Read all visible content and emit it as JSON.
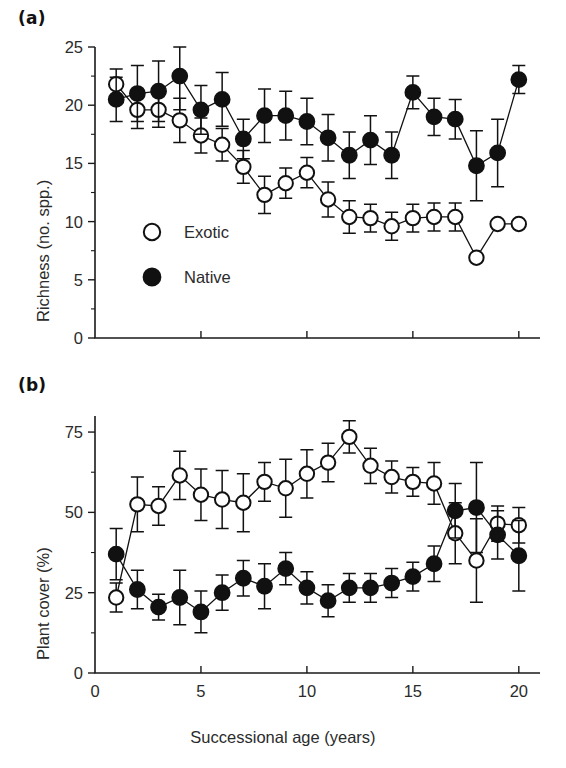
{
  "figure": {
    "panel_a_tag": "(a)",
    "panel_b_tag": "(b)",
    "x_axis_title": "Successional age (years)",
    "panel_a_y_title": "Richness (no. spp.)",
    "panel_b_y_title": "Plant cover (%)",
    "legend": {
      "exotic_label": "Exotic",
      "native_label": "Native",
      "exotic_marker": "open-circle",
      "native_marker": "filled-circle"
    },
    "marker_color": "#111111",
    "background_color": "#ffffff"
  },
  "chart_data": [
    {
      "type": "line",
      "panel": "(a)",
      "title": "Richness (no. spp.) vs Successional age",
      "xlabel": "Successional age (years)",
      "ylabel": "Richness (no. spp.)",
      "xlim": [
        0,
        21
      ],
      "ylim": [
        0,
        25
      ],
      "xticks": [
        0,
        5,
        10,
        15,
        20
      ],
      "xtick_labels": [
        "0",
        "5",
        "10",
        "15",
        "20"
      ],
      "yticks": [
        0,
        5,
        10,
        15,
        20,
        25
      ],
      "ytick_labels": [
        "0",
        "5",
        "10",
        "15",
        "20",
        "25"
      ],
      "yticks_minor": [
        2.5,
        7.5,
        12.5,
        17.5,
        22.5
      ],
      "grid": false,
      "legend_position": "inside-lower-left",
      "x": [
        1,
        2,
        3,
        4,
        5,
        6,
        7,
        8,
        9,
        10,
        11,
        12,
        13,
        14,
        15,
        16,
        17,
        18,
        19,
        20
      ],
      "series": [
        {
          "name": "Exotic",
          "marker": "open-circle",
          "values": [
            21.8,
            19.6,
            19.6,
            18.7,
            17.4,
            16.6,
            14.7,
            12.3,
            13.3,
            14.2,
            11.9,
            10.4,
            10.3,
            9.6,
            10.3,
            10.4,
            10.4,
            6.9,
            9.8,
            9.8
          ],
          "errors": [
            1.3,
            1.6,
            1.5,
            1.9,
            1.5,
            1.4,
            1.4,
            1.6,
            1.3,
            1.3,
            1.5,
            1.4,
            1.2,
            1.2,
            1.2,
            1.2,
            1.2,
            0.0,
            0.0,
            0.0
          ]
        },
        {
          "name": "Native",
          "marker": "filled-circle",
          "values": [
            20.5,
            21.0,
            21.2,
            22.5,
            19.6,
            20.5,
            17.1,
            19.1,
            19.1,
            18.6,
            17.2,
            15.7,
            17.0,
            15.7,
            21.1,
            19.0,
            18.8,
            14.8,
            15.9,
            22.2
          ],
          "errors": [
            1.9,
            2.4,
            2.6,
            2.9,
            2.1,
            2.3,
            1.7,
            2.3,
            2.1,
            2.0,
            2.0,
            2.0,
            2.1,
            2.0,
            1.4,
            1.6,
            1.7,
            3.0,
            2.9,
            1.2
          ]
        }
      ]
    },
    {
      "type": "line",
      "panel": "(b)",
      "title": "Plant cover (%) vs Successional age",
      "xlabel": "Successional age (years)",
      "ylabel": "Plant cover (%)",
      "xlim": [
        0,
        21
      ],
      "ylim": [
        0,
        80
      ],
      "xticks": [
        0,
        5,
        10,
        15,
        20
      ],
      "xtick_labels": [
        "0",
        "5",
        "10",
        "15",
        "20"
      ],
      "yticks": [
        0,
        25,
        50,
        75
      ],
      "ytick_labels": [
        "0",
        "25",
        "50",
        "75"
      ],
      "yticks_minor": [
        12.5,
        37.5,
        62.5
      ],
      "grid": false,
      "legend_position": "none",
      "x": [
        1,
        2,
        3,
        4,
        5,
        6,
        7,
        8,
        9,
        10,
        11,
        12,
        13,
        14,
        15,
        16,
        17,
        18,
        19,
        20
      ],
      "series": [
        {
          "name": "Exotic",
          "marker": "open-circle",
          "values": [
            23.5,
            52.5,
            52.0,
            61.5,
            55.5,
            54.0,
            53.0,
            59.5,
            57.5,
            62.0,
            65.5,
            73.5,
            64.5,
            61.0,
            59.5,
            59.0,
            43.5,
            35.0,
            46.5,
            46.0
          ],
          "errors": [
            4.5,
            8.5,
            6.0,
            7.5,
            8.0,
            9.0,
            9.0,
            6.0,
            9.0,
            7.5,
            6.0,
            5.0,
            5.5,
            5.0,
            4.5,
            6.5,
            9.5,
            13.0,
            5.5,
            5.5
          ]
        },
        {
          "name": "Native",
          "marker": "filled-circle",
          "values": [
            37.0,
            26.0,
            20.5,
            23.5,
            19.0,
            25.0,
            29.5,
            27.0,
            32.5,
            26.5,
            22.5,
            26.5,
            26.5,
            28.0,
            30.0,
            34.0,
            50.5,
            51.5,
            43.0,
            36.5
          ],
          "errors": [
            8.0,
            6.0,
            4.0,
            8.5,
            6.5,
            5.5,
            5.5,
            7.0,
            5.0,
            5.0,
            5.0,
            4.5,
            4.5,
            4.5,
            4.5,
            5.5,
            8.5,
            14.0,
            7.5,
            11.0
          ]
        }
      ]
    }
  ]
}
